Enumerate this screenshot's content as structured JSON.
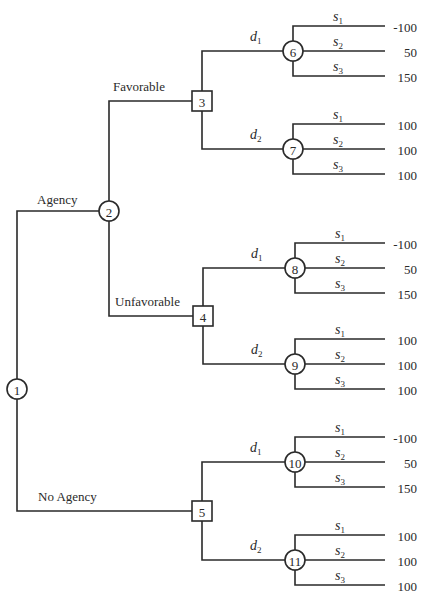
{
  "diagram": {
    "type": "decision-tree",
    "root": {
      "id": "1",
      "kind": "chance",
      "branches": [
        {
          "label": "Agency",
          "node": {
            "id": "2",
            "kind": "chance",
            "branches": [
              {
                "label": "Favorable",
                "node": {
                  "id": "3",
                  "kind": "decision",
                  "branches": [
                    {
                      "label": "d",
                      "sub": "1",
                      "node": {
                        "id": "6",
                        "kind": "chance",
                        "outcomes": [
                          {
                            "label": "s",
                            "sub": "1",
                            "payoff": "-100"
                          },
                          {
                            "label": "s",
                            "sub": "2",
                            "payoff": "50"
                          },
                          {
                            "label": "s",
                            "sub": "3",
                            "payoff": "150"
                          }
                        ]
                      }
                    },
                    {
                      "label": "d",
                      "sub": "2",
                      "node": {
                        "id": "7",
                        "kind": "chance",
                        "outcomes": [
                          {
                            "label": "s",
                            "sub": "1",
                            "payoff": "100"
                          },
                          {
                            "label": "s",
                            "sub": "2",
                            "payoff": "100"
                          },
                          {
                            "label": "s",
                            "sub": "3",
                            "payoff": "100"
                          }
                        ]
                      }
                    }
                  ]
                }
              },
              {
                "label": "Unfavorable",
                "node": {
                  "id": "4",
                  "kind": "decision",
                  "branches": [
                    {
                      "label": "d",
                      "sub": "1",
                      "node": {
                        "id": "8",
                        "kind": "chance",
                        "outcomes": [
                          {
                            "label": "s",
                            "sub": "1",
                            "payoff": "-100"
                          },
                          {
                            "label": "s",
                            "sub": "2",
                            "payoff": "50"
                          },
                          {
                            "label": "s",
                            "sub": "3",
                            "payoff": "150"
                          }
                        ]
                      }
                    },
                    {
                      "label": "d",
                      "sub": "2",
                      "node": {
                        "id": "9",
                        "kind": "chance",
                        "outcomes": [
                          {
                            "label": "s",
                            "sub": "1",
                            "payoff": "100"
                          },
                          {
                            "label": "s",
                            "sub": "2",
                            "payoff": "100"
                          },
                          {
                            "label": "s",
                            "sub": "3",
                            "payoff": "100"
                          }
                        ]
                      }
                    }
                  ]
                }
              }
            ]
          }
        },
        {
          "label": "No Agency",
          "node": {
            "id": "5",
            "kind": "decision",
            "branches": [
              {
                "label": "d",
                "sub": "1",
                "node": {
                  "id": "10",
                  "kind": "chance",
                  "outcomes": [
                    {
                      "label": "s",
                      "sub": "1",
                      "payoff": "-100"
                    },
                    {
                      "label": "s",
                      "sub": "2",
                      "payoff": "50"
                    },
                    {
                      "label": "s",
                      "sub": "3",
                      "payoff": "150"
                    }
                  ]
                }
              },
              {
                "label": "d",
                "sub": "2",
                "node": {
                  "id": "11",
                  "kind": "chance",
                  "outcomes": [
                    {
                      "label": "s",
                      "sub": "1",
                      "payoff": "100"
                    },
                    {
                      "label": "s",
                      "sub": "2",
                      "payoff": "100"
                    },
                    {
                      "label": "s",
                      "sub": "3",
                      "payoff": "100"
                    }
                  ]
                }
              }
            ]
          }
        }
      ]
    }
  }
}
